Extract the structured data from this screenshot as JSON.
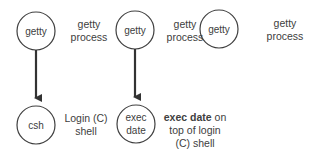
{
  "columns": [
    {
      "top_node": {
        "label": "getty",
        "cx": 36,
        "cy": 31
      },
      "top_caption": [
        "getty",
        "process"
      ],
      "arrow": true,
      "bottom_node": {
        "lines": [
          "csh"
        ],
        "cx": 36,
        "cy": 125
      },
      "bottom_caption": {
        "bold": "",
        "rest": "Login (C)",
        "line2": "shell",
        "line3": ""
      }
    },
    {
      "top_node": {
        "label": "getty",
        "cx": 135,
        "cy": 30
      },
      "top_caption": [
        "getty",
        "process"
      ],
      "arrow": true,
      "bottom_node": {
        "lines": [
          "exec",
          "date"
        ],
        "cx": 136,
        "cy": 124
      },
      "bottom_caption": {
        "bold": "exec date",
        "rest": " on",
        "line2": "top of login",
        "line3": "(C) shell"
      }
    },
    {
      "top_node": {
        "label": "getty",
        "cx": 219,
        "cy": 29
      },
      "top_caption": [
        "getty",
        "process"
      ],
      "arrow": false
    }
  ],
  "colors": {
    "stroke": "#404040",
    "text": "#404040",
    "background": "#ffffff"
  }
}
